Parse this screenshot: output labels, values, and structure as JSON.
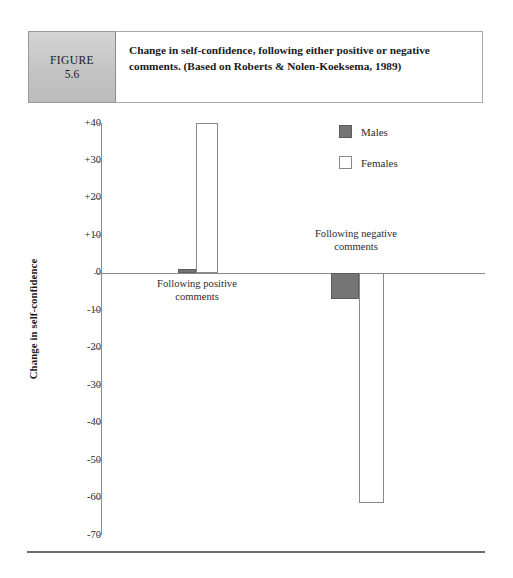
{
  "figure": {
    "badge_word": "FIGURE",
    "badge_number": "5.6",
    "caption": "Change in self-confidence, following either positive or negative comments. (Based on Roberts & Nolen-Koeksema, 1989)"
  },
  "legend": {
    "position": "top-right",
    "entries": [
      {
        "label": "Males",
        "swatch": "filled-gray-square",
        "color": "#757575"
      },
      {
        "label": "Females",
        "swatch": "outlined-white-square",
        "color": "#ffffff"
      }
    ]
  },
  "axis": {
    "y_label": "Change in self-confidence",
    "y_ticks": [
      "+40",
      "+30",
      "+20",
      "+10",
      "0",
      "-10",
      "-20",
      "-30",
      "-40",
      "-50",
      "-60",
      "-70"
    ]
  },
  "categories": [
    {
      "line1": "Following positive",
      "line2": "comments"
    },
    {
      "line1": "Following negative",
      "line2": "comments"
    }
  ],
  "chart_data": {
    "type": "bar",
    "title": "Change in self-confidence, following either positive or negative comments. (Based on Roberts & Nolen-Koeksema, 1989)",
    "categories": [
      "Following positive comments",
      "Following negative comments"
    ],
    "series": [
      {
        "name": "Males",
        "values": [
          1,
          -7
        ],
        "color": "#757575"
      },
      {
        "name": "Females",
        "values": [
          40,
          -61.5
        ],
        "color": "#ffffff"
      }
    ],
    "xlabel": "",
    "ylabel": "Change in self-confidence",
    "ylim": [
      -70,
      40
    ],
    "ytick_values": [
      40,
      30,
      20,
      10,
      0,
      -10,
      -20,
      -30,
      -40,
      -50,
      -60,
      -70
    ],
    "ytick_labels": [
      "+40",
      "+30",
      "+20",
      "+10",
      "0",
      "-10",
      "-20",
      "-30",
      "-40",
      "-50",
      "-60",
      "-70"
    ],
    "grid": false,
    "legend_position": "top-right",
    "zero_line": true
  },
  "bars": [
    {
      "name": "males-positive",
      "value": 1,
      "top": 161.0,
      "height": 3.8,
      "left": 178,
      "width": 18
    },
    {
      "name": "females-positive",
      "value": 40,
      "top": 15.0,
      "height": 149.8,
      "left": 196,
      "width": 22
    },
    {
      "name": "males-negative",
      "value": -7,
      "top": 164.8,
      "height": 26.2,
      "left": 331,
      "width": 28
    },
    {
      "name": "females-negative",
      "value": -61.5,
      "top": 164.8,
      "height": 230.3,
      "left": 359,
      "width": 25
    }
  ],
  "tick_layout": [
    {
      "label": "+40",
      "top": 9.5
    },
    {
      "label": "+30",
      "top": 47.0
    },
    {
      "label": "+20",
      "top": 84.4
    },
    {
      "label": "+10",
      "top": 121.9
    },
    {
      "label": "0",
      "top": 159.3
    },
    {
      "label": "-10",
      "top": 196.8
    },
    {
      "label": "-20",
      "top": 234.2
    },
    {
      "label": "-30",
      "top": 271.7
    },
    {
      "label": "-40",
      "top": 309.1
    },
    {
      "label": "-50",
      "top": 346.6
    },
    {
      "label": "-60",
      "top": 384.0
    },
    {
      "label": "-70",
      "top": 421.5
    }
  ]
}
